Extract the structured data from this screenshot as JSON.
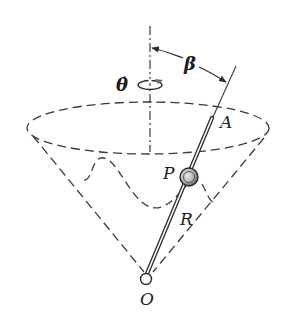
{
  "figure": {
    "labels": {
      "theta_dot": "θ̇",
      "beta": "β",
      "point_A": "A",
      "point_P": "P",
      "point_R": "R",
      "point_O": "O"
    },
    "elements": {
      "axis": "vertical axis of rotation (dash-dot)",
      "cone": "inverted cone surface (dashed)",
      "rim": "cone rim ellipse (dashed)",
      "path": "wavy path of P on cone (dashed)",
      "rod": "rod OA",
      "slider": "sphere P on rod"
    },
    "colors": {
      "ink": "#2a2a2a",
      "rotation_arrow": "#6a6a6a",
      "sphere_fill": "#b8b8b8",
      "background": "#ffffff"
    }
  }
}
